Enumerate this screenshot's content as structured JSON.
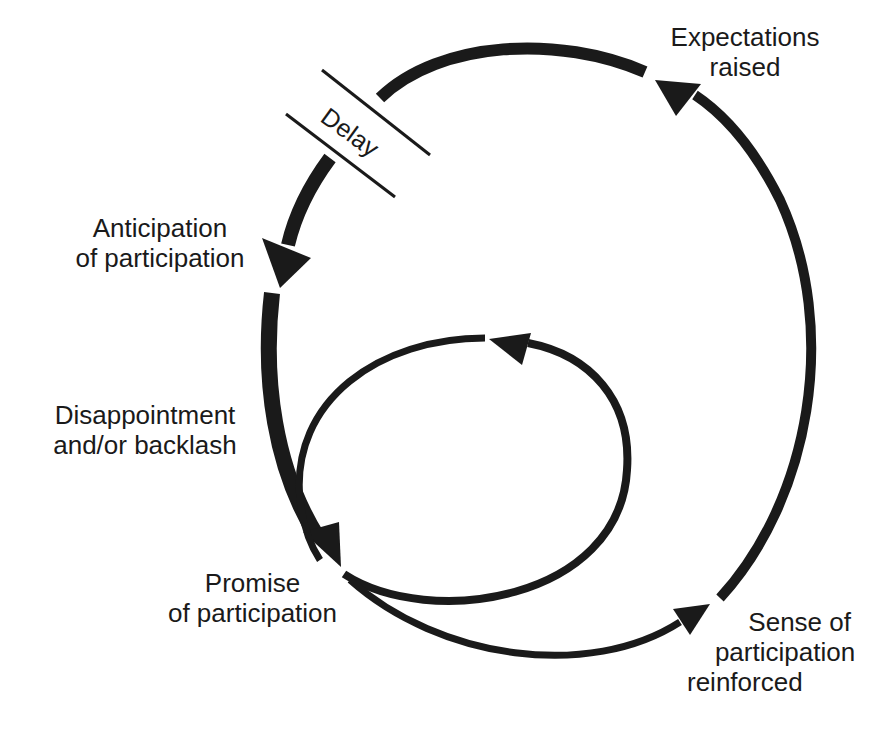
{
  "diagram": {
    "colors": {
      "ink": "#1a1a1a",
      "background": "#ffffff"
    },
    "nodes": {
      "expectations_raised": {
        "line1": "Expectations",
        "line2": "raised"
      },
      "anticipation": {
        "line1": "Anticipation",
        "line2": "of participation"
      },
      "disappointment": {
        "line1": "Disappointment",
        "line2": "and/or backlash"
      },
      "promise": {
        "line1": "Promise",
        "line2": "of participation"
      },
      "sense_reinforced": {
        "line1": "Sense of",
        "line2": "participation",
        "line3": "reinforced"
      }
    },
    "delay_marker": {
      "label": "Delay"
    },
    "edges": [
      {
        "from": "Expectations raised",
        "to": "Anticipation of participation",
        "style": "thick",
        "note": "interrupted by Delay marker"
      },
      {
        "from": "Anticipation of participation",
        "to": "Promise of participation",
        "style": "thick",
        "via": "Disappointment and/or backlash"
      },
      {
        "from": "Promise of participation",
        "to": "Sense of participation reinforced",
        "style": "medium"
      },
      {
        "from": "Sense of participation reinforced",
        "to": "Expectations raised",
        "style": "medium"
      },
      {
        "from": "Promise of participation",
        "to": "Promise of participation",
        "style": "medium",
        "note": "inner loop"
      }
    ]
  }
}
